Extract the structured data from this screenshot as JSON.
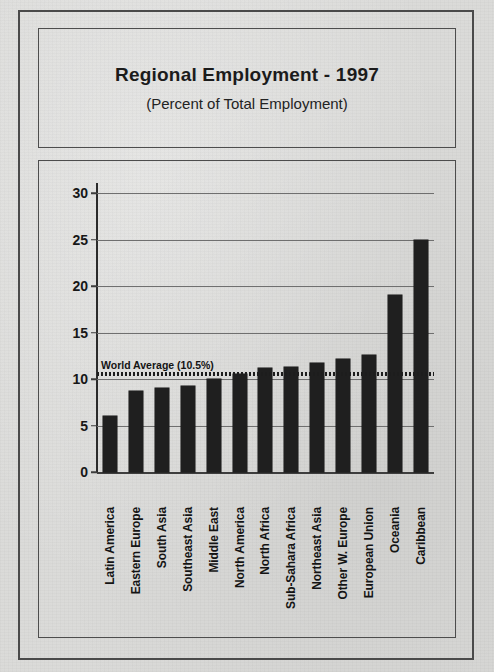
{
  "chart_data": {
    "type": "bar",
    "title": "Regional Employment - 1997",
    "subtitle": "(Percent of Total Employment)",
    "xlabel": "",
    "ylabel": "",
    "ylim": [
      0,
      30
    ],
    "ytick_step": 5,
    "yticks": [
      "0",
      "5",
      "10",
      "15",
      "20",
      "25",
      "30"
    ],
    "grid": true,
    "legend": "none",
    "bar_color": "#1f1f1f",
    "categories": [
      "Latin America",
      "Eastern Europe",
      "South Asia",
      "Southeast Asia",
      "Middle East",
      "North America",
      "North Africa",
      "Sub-Sahara Africa",
      "Northeast Asia",
      "Other W. Europe",
      "European Union",
      "Oceania",
      "Caribbean"
    ],
    "values": [
      6.0,
      8.7,
      9.0,
      9.2,
      10.0,
      10.5,
      11.2,
      11.3,
      11.7,
      12.1,
      12.6,
      19.0,
      25.0
    ],
    "annotations": [
      {
        "name": "world-average",
        "label": "World Average (10.5%)",
        "value": 10.5,
        "style": "dotted-horizontal-line"
      }
    ]
  }
}
